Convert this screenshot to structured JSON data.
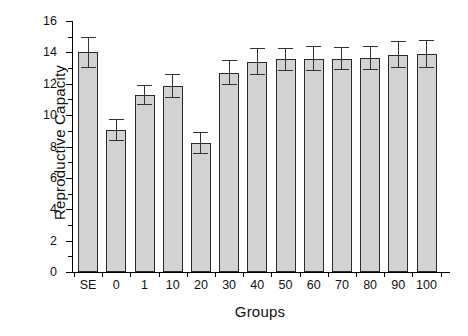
{
  "chart_data": {
    "type": "bar",
    "title": "",
    "xlabel": "Groups",
    "ylabel": "Reproductive Capacity",
    "categories": [
      "SE",
      "0",
      "1",
      "10",
      "20",
      "30",
      "40",
      "50",
      "60",
      "70",
      "80",
      "90",
      "100"
    ],
    "values": [
      14.0,
      9.05,
      11.3,
      11.85,
      8.25,
      12.7,
      13.4,
      13.55,
      13.6,
      13.6,
      13.65,
      13.85,
      13.9
    ],
    "errors": [
      1.0,
      0.7,
      0.65,
      0.75,
      0.7,
      0.8,
      0.85,
      0.75,
      0.8,
      0.75,
      0.75,
      0.85,
      0.9
    ],
    "ylim": [
      0,
      16
    ],
    "ytick_labels": [
      "0",
      "2",
      "4",
      "6",
      "8",
      "10",
      "12",
      "14",
      "16"
    ],
    "ytick_values": [
      0,
      2,
      4,
      6,
      8,
      10,
      12,
      14,
      16
    ],
    "yminor_values": [
      1,
      3,
      5,
      7,
      9,
      11,
      13,
      15
    ],
    "grid": false,
    "legend": null,
    "bar_color": "#d2d2d2",
    "bar_edge_color": "#2a2a2a",
    "error_color": "#333333",
    "axis_color": "#000000",
    "background_color": "#ffffff"
  }
}
